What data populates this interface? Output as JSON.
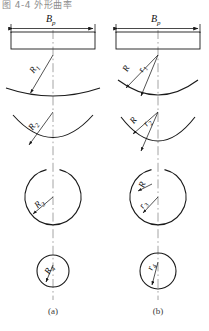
{
  "figure": {
    "top_note": "图 4-4  外形曲率",
    "captions": {
      "left": "(a)",
      "right": "(b)"
    },
    "dimension_label": {
      "base": "B",
      "sub": "p"
    }
  },
  "panels": [
    {
      "id": "a",
      "caption": "(a)",
      "dimension": {
        "base": "B",
        "sub": "p"
      },
      "stages": [
        {
          "id": "a1",
          "labels": [
            {
              "base": "R",
              "sub": "1"
            }
          ]
        },
        {
          "id": "a2",
          "labels": [
            {
              "base": "R",
              "sub": "2"
            }
          ]
        },
        {
          "id": "a3",
          "labels": [
            {
              "base": "R",
              "sub": "3"
            }
          ]
        },
        {
          "id": "a4",
          "labels": [
            {
              "base": "R",
              "sub": "4"
            }
          ]
        }
      ]
    },
    {
      "id": "b",
      "caption": "(b)",
      "dimension": {
        "base": "B",
        "sub": "p"
      },
      "stages": [
        {
          "id": "b1",
          "labels": [
            {
              "base": "R",
              "sub": ""
            },
            {
              "base": "r",
              "sub": "1"
            }
          ]
        },
        {
          "id": "b2",
          "labels": [
            {
              "base": "R",
              "sub": ""
            },
            {
              "base": "r",
              "sub": "2"
            }
          ]
        },
        {
          "id": "b3",
          "labels": [
            {
              "base": "R",
              "sub": ""
            },
            {
              "base": "r",
              "sub": "3"
            }
          ]
        },
        {
          "id": "b4",
          "labels": [
            {
              "base": "R",
              "sub": ""
            },
            {
              "base": "r",
              "sub": "4"
            }
          ]
        }
      ]
    }
  ],
  "style": {
    "line_color": "#1a1a1a",
    "center_line_color": "#9a9a9a",
    "background": "#ffffff"
  }
}
